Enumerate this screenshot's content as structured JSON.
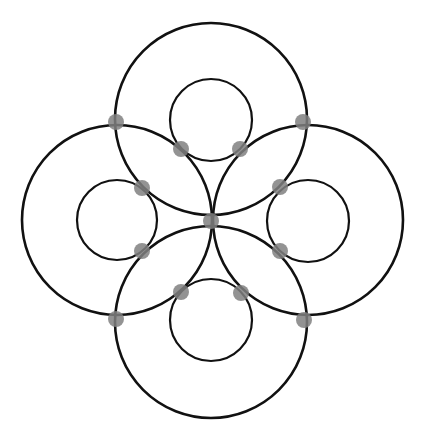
{
  "diagram": {
    "width": 424,
    "height": 445,
    "background": "#ffffff",
    "stroke_color": "#111111",
    "dot_color": "#808080",
    "center": {
      "x": 211,
      "y": 220
    },
    "large_circles": [
      {
        "name": "top",
        "cx": 211,
        "cy": 119,
        "r": 96
      },
      {
        "name": "left",
        "cx": 117,
        "cy": 220,
        "r": 95
      },
      {
        "name": "right",
        "cx": 308,
        "cy": 220,
        "r": 95
      },
      {
        "name": "bottom",
        "cx": 211,
        "cy": 322,
        "r": 96
      }
    ],
    "inner_circles": [
      {
        "name": "top",
        "cx": 211,
        "cy": 120,
        "r": 41
      },
      {
        "name": "left",
        "cx": 117,
        "cy": 220,
        "r": 40
      },
      {
        "name": "right",
        "cx": 308,
        "cy": 221,
        "r": 41
      },
      {
        "name": "bottom",
        "cx": 211,
        "cy": 320,
        "r": 41
      }
    ],
    "dots": [
      {
        "cx": 116,
        "cy": 122
      },
      {
        "cx": 303,
        "cy": 122
      },
      {
        "cx": 116,
        "cy": 319
      },
      {
        "cx": 304,
        "cy": 320
      },
      {
        "cx": 181,
        "cy": 149
      },
      {
        "cx": 240,
        "cy": 149
      },
      {
        "cx": 142,
        "cy": 188
      },
      {
        "cx": 280,
        "cy": 187
      },
      {
        "cx": 142,
        "cy": 251
      },
      {
        "cx": 280,
        "cy": 251
      },
      {
        "cx": 181,
        "cy": 292
      },
      {
        "cx": 241,
        "cy": 293
      },
      {
        "cx": 211,
        "cy": 221
      }
    ],
    "dot_radius": 8
  }
}
